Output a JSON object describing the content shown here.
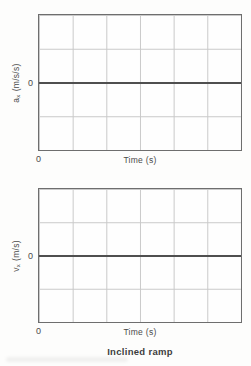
{
  "colors": {
    "grid": "#c9c9c9",
    "frame": "#6e6e6e",
    "zero_line": "#4f4f4f",
    "text": "#4a4a4a",
    "caption": "#3e3e3e"
  },
  "charts": [
    {
      "y_axis": {
        "symbol": "a",
        "subscript": "x",
        "unit": "(m/s/s)",
        "zero_label": "0"
      },
      "x_axis": {
        "origin_label": "0",
        "title": "Time (s)"
      },
      "grid": {
        "columns": 6,
        "rows": 4
      }
    },
    {
      "y_axis": {
        "symbol": "v",
        "subscript": "x",
        "unit": "(m/s)",
        "zero_label": "0"
      },
      "x_axis": {
        "origin_label": "0",
        "title": "Time (s)"
      },
      "grid": {
        "columns": 6,
        "rows": 4
      }
    }
  ],
  "caption": "Inclined ramp",
  "chart_data": [
    {
      "type": "line",
      "title": "",
      "xlabel": "Time (s)",
      "ylabel": "a_x (m/s/s)",
      "x_tick_labels": [
        "0"
      ],
      "y_tick_labels": [
        "0"
      ],
      "grid": true,
      "grid_columns": 6,
      "grid_rows": 4,
      "zero_line_at_vertical_middle": true,
      "series": []
    },
    {
      "type": "line",
      "title": "",
      "xlabel": "Time (s)",
      "ylabel": "v_x (m/s)",
      "x_tick_labels": [
        "0"
      ],
      "y_tick_labels": [
        "0"
      ],
      "grid": true,
      "grid_columns": 6,
      "grid_rows": 4,
      "zero_line_at_vertical_middle": true,
      "series": []
    }
  ]
}
